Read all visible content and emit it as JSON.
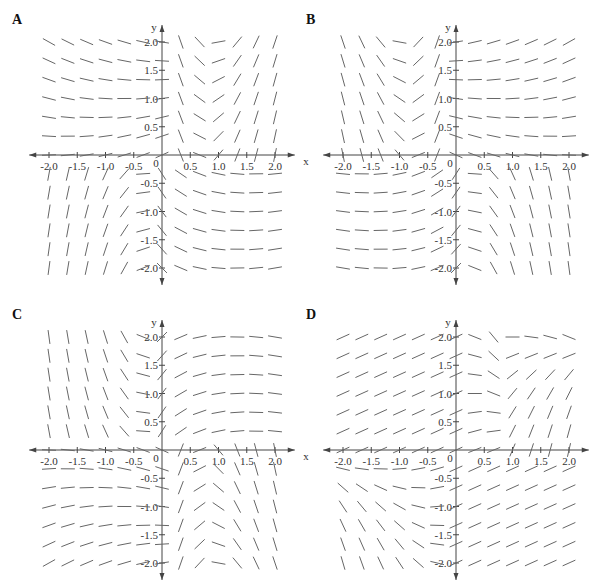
{
  "figure": {
    "panels": [
      {
        "label": "A",
        "origin": [
          162,
          155
        ]
      },
      {
        "label": "B",
        "origin": [
          456,
          155
        ]
      },
      {
        "label": "C",
        "origin": [
          162,
          450
        ]
      },
      {
        "label": "D",
        "origin": [
          456,
          450
        ]
      }
    ],
    "axes": {
      "x_label": "x",
      "y_label": "y",
      "x_ticks": [
        "-2.0",
        "-1.5",
        "-1.0",
        "-0.5",
        "0.5",
        "1.0",
        "1.5",
        "2.0"
      ],
      "y_ticks": [
        "2.0",
        "1.5",
        "1.0",
        "0.5",
        "-0.5",
        "-1.0",
        "-1.5",
        "-2.0"
      ],
      "origin_label": "0",
      "range": [
        -2.2,
        2.2
      ]
    },
    "colors": {
      "axis": "#444444",
      "segment": "#666666",
      "label": "#333333"
    }
  },
  "chart_data": [
    {
      "type": "slope_field",
      "title": "A",
      "xlabel": "x",
      "ylabel": "y",
      "xlim": [
        -2.2,
        2.2
      ],
      "ylim": [
        -2.2,
        2.2
      ],
      "notes": "Upper-left horizontal, upper-right near vertical (negative near axis, positive at large x); lower-left near vertical, lower-right horizontal"
    },
    {
      "type": "slope_field",
      "title": "B",
      "xlabel": "x",
      "ylabel": "y",
      "xlim": [
        -2.2,
        2.2
      ],
      "ylim": [
        -2.2,
        2.2
      ],
      "notes": "Upper-left near vertical, upper-right horizontal; lower-left horizontal, lower-right near vertical"
    },
    {
      "type": "slope_field",
      "title": "C",
      "xlabel": "x",
      "ylabel": "y",
      "xlim": [
        -2.2,
        2.2
      ],
      "ylim": [
        -2.2,
        2.2
      ],
      "notes": "Upper-left horizontal trending negative lower, upper-right steep positive; lower-left steep, lower-right horizontal positive"
    },
    {
      "type": "slope_field",
      "title": "D",
      "xlabel": "x",
      "ylabel": "y",
      "xlim": [
        -2.2,
        2.2
      ],
      "ylim": [
        -2.2,
        2.2
      ],
      "notes": "Upper-left gentle positive, upper-right steep negative to vertical; lower-left steep positive to vertical, lower-right gentle positive"
    }
  ]
}
